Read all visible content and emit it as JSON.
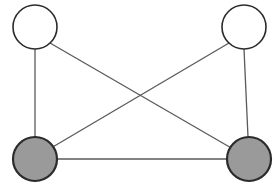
{
  "diagram": {
    "type": "undirected-graph",
    "canvas": {
      "width": 276,
      "height": 196,
      "background": "#ffffff"
    },
    "style": {
      "edge_color": "#5a5a5a",
      "edge_width": 1.3,
      "node_radius": 22,
      "unfilled_node_fill": "#ffffff",
      "unfilled_node_stroke": "#2b2b2b",
      "unfilled_node_stroke_width": 1.6,
      "filled_node_fill": "#9a9a9a",
      "filled_node_stroke": "#2b2b2b",
      "filled_node_stroke_width": 2.2
    },
    "nodes": [
      {
        "id": "top-left",
        "name": "node-top-left",
        "cx": 35,
        "cy": 27,
        "r": 22,
        "state": "unfilled",
        "fill": "#ffffff",
        "stroke": "#2b2b2b",
        "stroke_width": 1.6
      },
      {
        "id": "top-right",
        "name": "node-top-right",
        "cx": 244,
        "cy": 27,
        "r": 22,
        "state": "unfilled",
        "fill": "#ffffff",
        "stroke": "#2b2b2b",
        "stroke_width": 1.6
      },
      {
        "id": "bottom-left",
        "name": "node-bottom-left",
        "cx": 35,
        "cy": 159,
        "r": 22,
        "state": "filled",
        "fill": "#9a9a9a",
        "stroke": "#2b2b2b",
        "stroke_width": 2.2
      },
      {
        "id": "bottom-right",
        "name": "node-bottom-right",
        "cx": 249,
        "cy": 159,
        "r": 22,
        "state": "filled",
        "fill": "#9a9a9a",
        "stroke": "#2b2b2b",
        "stroke_width": 2.2
      }
    ],
    "edges": [
      {
        "id": "edge-left-vertical",
        "name": "edge-top-left-to-bottom-left",
        "from": "top-left",
        "to": "bottom-left",
        "x1": 35,
        "y1": 49,
        "x2": 35,
        "y2": 137,
        "orientation": "vertical"
      },
      {
        "id": "edge-right-vertical",
        "name": "edge-top-right-to-bottom-right",
        "from": "top-right",
        "to": "bottom-right",
        "x1": 244,
        "y1": 49,
        "x2": 248,
        "y2": 137,
        "orientation": "vertical"
      },
      {
        "id": "edge-bottom-horizontal",
        "name": "edge-bottom-left-to-bottom-right",
        "from": "bottom-left",
        "to": "bottom-right",
        "x1": 57,
        "y1": 159,
        "x2": 227,
        "y2": 159,
        "orientation": "horizontal"
      },
      {
        "id": "edge-diagonal-tl-br",
        "name": "edge-top-left-to-bottom-right",
        "from": "top-left",
        "to": "bottom-right",
        "x1": 50,
        "y1": 43,
        "x2": 233,
        "y2": 149,
        "orientation": "diagonal"
      },
      {
        "id": "edge-diagonal-tr-bl",
        "name": "edge-top-right-to-bottom-left",
        "from": "top-right",
        "to": "bottom-left",
        "x1": 229,
        "y1": 43,
        "x2": 51,
        "y2": 148,
        "orientation": "diagonal"
      }
    ],
    "crossing_point": {
      "x": 139,
      "y": 96
    },
    "counts": {
      "nodes": 4,
      "edges": 5,
      "filled_nodes": 2,
      "unfilled_nodes": 2
    }
  }
}
